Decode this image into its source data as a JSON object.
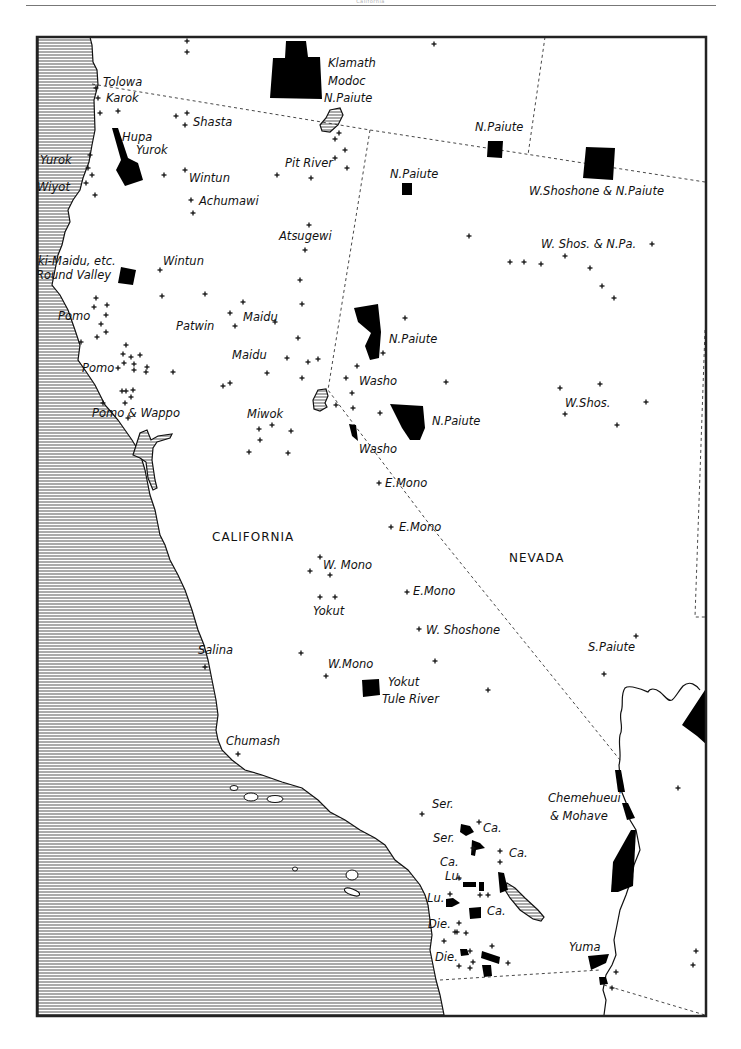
{
  "page": {
    "header_text": "California"
  },
  "colors": {
    "ink": "#111111",
    "paper": "#ffffff",
    "water_hatch": "#555555",
    "border": "#222222"
  },
  "states": [
    {
      "name": "CALIFORNIA",
      "x": 212,
      "y": 541
    },
    {
      "name": "NEVADA",
      "x": 509,
      "y": 562
    }
  ],
  "labels": [
    {
      "text": "Tolowa",
      "x": 103,
      "y": 86
    },
    {
      "text": "Karok",
      "x": 106,
      "y": 102
    },
    {
      "text": "Shasta",
      "x": 193,
      "y": 126
    },
    {
      "text": "Hupa",
      "x": 122,
      "y": 141
    },
    {
      "text": "Yurok",
      "x": 136,
      "y": 154
    },
    {
      "text": "Yurok",
      "x": 40,
      "y": 164
    },
    {
      "text": "Wiyot",
      "x": 37,
      "y": 191
    },
    {
      "text": "Wintun",
      "x": 189,
      "y": 182
    },
    {
      "text": "Achumawi",
      "x": 199,
      "y": 205
    },
    {
      "text": "Klamath",
      "x": 328,
      "y": 67
    },
    {
      "text": "Modoc",
      "x": 328,
      "y": 85
    },
    {
      "text": "N.Paiute",
      "x": 324,
      "y": 102
    },
    {
      "text": "N.Paiute",
      "x": 475,
      "y": 131
    },
    {
      "text": "Pit River",
      "x": 285,
      "y": 167
    },
    {
      "text": "N.Paiute",
      "x": 390,
      "y": 178
    },
    {
      "text": "W.Shoshone & N.Paiute",
      "x": 529,
      "y": 195
    },
    {
      "text": "Atsugewi",
      "x": 279,
      "y": 240
    },
    {
      "text": "W. Shos. & N.Pa.",
      "x": 541,
      "y": 248
    },
    {
      "text": "ki-Maidu, etc.",
      "x": 38,
      "y": 265
    },
    {
      "text": "Wintun",
      "x": 163,
      "y": 265
    },
    {
      "text": "Round Valley",
      "x": 36,
      "y": 279
    },
    {
      "text": "Pomo",
      "x": 58,
      "y": 320
    },
    {
      "text": "Maidu",
      "x": 243,
      "y": 321
    },
    {
      "text": "Patwin",
      "x": 176,
      "y": 330
    },
    {
      "text": "N.Paiute",
      "x": 389,
      "y": 343
    },
    {
      "text": "Maidu",
      "x": 232,
      "y": 359
    },
    {
      "text": "Pomo",
      "x": 82,
      "y": 372
    },
    {
      "text": "Washo",
      "x": 359,
      "y": 385
    },
    {
      "text": "W.Shos.",
      "x": 565,
      "y": 407
    },
    {
      "text": "Pomo & Wappo",
      "x": 92,
      "y": 417
    },
    {
      "text": "Miwok",
      "x": 247,
      "y": 418
    },
    {
      "text": "N.Paiute",
      "x": 432,
      "y": 425
    },
    {
      "text": "Washo",
      "x": 359,
      "y": 453
    },
    {
      "text": "E.Mono",
      "x": 385,
      "y": 487
    },
    {
      "text": "E.Mono",
      "x": 399,
      "y": 531
    },
    {
      "text": "W. Mono",
      "x": 323,
      "y": 569
    },
    {
      "text": "E.Mono",
      "x": 413,
      "y": 595
    },
    {
      "text": "Yokut",
      "x": 313,
      "y": 615
    },
    {
      "text": "W. Shoshone",
      "x": 426,
      "y": 634
    },
    {
      "text": "S.Paiute",
      "x": 588,
      "y": 651
    },
    {
      "text": "Salina",
      "x": 198,
      "y": 654
    },
    {
      "text": "W.Mono",
      "x": 328,
      "y": 668
    },
    {
      "text": "Yokut",
      "x": 388,
      "y": 686
    },
    {
      "text": "Tule River",
      "x": 382,
      "y": 703
    },
    {
      "text": "Chumash",
      "x": 226,
      "y": 745
    },
    {
      "text": "Chemehueui",
      "x": 548,
      "y": 802
    },
    {
      "text": "& Mohave",
      "x": 550,
      "y": 820
    },
    {
      "text": "Ser.",
      "x": 432,
      "y": 808
    },
    {
      "text": "Ca.",
      "x": 483,
      "y": 832
    },
    {
      "text": "Ser.",
      "x": 433,
      "y": 842
    },
    {
      "text": "Ca.",
      "x": 509,
      "y": 857
    },
    {
      "text": "Ca.",
      "x": 440,
      "y": 866
    },
    {
      "text": "Lu.",
      "x": 445,
      "y": 880
    },
    {
      "text": "Lu.",
      "x": 427,
      "y": 902
    },
    {
      "text": "Ca.",
      "x": 487,
      "y": 915
    },
    {
      "text": "Die.",
      "x": 428,
      "y": 928
    },
    {
      "text": "Yuma",
      "x": 569,
      "y": 951
    },
    {
      "text": "Die.",
      "x": 435,
      "y": 961
    }
  ],
  "settlements": [
    [
      187,
      41
    ],
    [
      187,
      52
    ],
    [
      434,
      44
    ],
    [
      96,
      88
    ],
    [
      98,
      98
    ],
    [
      100,
      113
    ],
    [
      118,
      111
    ],
    [
      176,
      116
    ],
    [
      187,
      113
    ],
    [
      185,
      125
    ],
    [
      90,
      155
    ],
    [
      88,
      168
    ],
    [
      92,
      175
    ],
    [
      86,
      183
    ],
    [
      95,
      195
    ],
    [
      164,
      175
    ],
    [
      185,
      170
    ],
    [
      277,
      175
    ],
    [
      335,
      158
    ],
    [
      345,
      150
    ],
    [
      335,
      139
    ],
    [
      339,
      133
    ],
    [
      347,
      168
    ],
    [
      311,
      178
    ],
    [
      193,
      213
    ],
    [
      191,
      200
    ],
    [
      309,
      225
    ],
    [
      305,
      250
    ],
    [
      469,
      236
    ],
    [
      510,
      262
    ],
    [
      524,
      262
    ],
    [
      541,
      264
    ],
    [
      565,
      256
    ],
    [
      590,
      268
    ],
    [
      602,
      286
    ],
    [
      614,
      298
    ],
    [
      652,
      244
    ],
    [
      160,
      270
    ],
    [
      162,
      296
    ],
    [
      96,
      298
    ],
    [
      94,
      307
    ],
    [
      107,
      305
    ],
    [
      106,
      315
    ],
    [
      101,
      324
    ],
    [
      106,
      332
    ],
    [
      97,
      337
    ],
    [
      81,
      342
    ],
    [
      205,
      294
    ],
    [
      243,
      302
    ],
    [
      230,
      313
    ],
    [
      235,
      326
    ],
    [
      300,
      280
    ],
    [
      302,
      304
    ],
    [
      298,
      338
    ],
    [
      275,
      322
    ],
    [
      126,
      345
    ],
    [
      123,
      354
    ],
    [
      131,
      357
    ],
    [
      140,
      355
    ],
    [
      134,
      364
    ],
    [
      124,
      363
    ],
    [
      118,
      368
    ],
    [
      147,
      367
    ],
    [
      146,
      372
    ],
    [
      134,
      370
    ],
    [
      173,
      372
    ],
    [
      230,
      383
    ],
    [
      223,
      386
    ],
    [
      287,
      358
    ],
    [
      318,
      359
    ],
    [
      302,
      378
    ],
    [
      267,
      373
    ],
    [
      308,
      362
    ],
    [
      126,
      391
    ],
    [
      125,
      403
    ],
    [
      131,
      397
    ],
    [
      122,
      391
    ],
    [
      133,
      390
    ],
    [
      128,
      418
    ],
    [
      103,
      403
    ],
    [
      405,
      318
    ],
    [
      357,
      366
    ],
    [
      346,
      378
    ],
    [
      352,
      393
    ],
    [
      353,
      408
    ],
    [
      380,
      413
    ],
    [
      383,
      353
    ],
    [
      446,
      382
    ],
    [
      560,
      388
    ],
    [
      600,
      384
    ],
    [
      565,
      414
    ],
    [
      646,
      402
    ],
    [
      617,
      425
    ],
    [
      259,
      429
    ],
    [
      272,
      425
    ],
    [
      291,
      431
    ],
    [
      260,
      440
    ],
    [
      249,
      452
    ],
    [
      288,
      453
    ],
    [
      336,
      405
    ],
    [
      379,
      483
    ],
    [
      391,
      527
    ],
    [
      320,
      557
    ],
    [
      310,
      571
    ],
    [
      330,
      575
    ],
    [
      320,
      597
    ],
    [
      335,
      597
    ],
    [
      407,
      592
    ],
    [
      419,
      629
    ],
    [
      301,
      653
    ],
    [
      326,
      676
    ],
    [
      435,
      661
    ],
    [
      488,
      690
    ],
    [
      636,
      636
    ],
    [
      604,
      674
    ],
    [
      205,
      667
    ],
    [
      238,
      754
    ],
    [
      678,
      788
    ],
    [
      422,
      814
    ],
    [
      479,
      822
    ],
    [
      473,
      848
    ],
    [
      500,
      851
    ],
    [
      500,
      862
    ],
    [
      459,
      878
    ],
    [
      480,
      895
    ],
    [
      488,
      895
    ],
    [
      450,
      894
    ],
    [
      459,
      923
    ],
    [
      455,
      932
    ],
    [
      457,
      932
    ],
    [
      466,
      933
    ],
    [
      444,
      941
    ],
    [
      470,
      951
    ],
    [
      492,
      946
    ],
    [
      473,
      962
    ],
    [
      459,
      966
    ],
    [
      470,
      968
    ],
    [
      508,
      963
    ],
    [
      616,
      972
    ],
    [
      612,
      988
    ],
    [
      696,
      951
    ],
    [
      693,
      965
    ]
  ],
  "reservations": [
    {
      "name": "klamath-modoc-npaiute",
      "points": "286,41 306,41 308,57 320,57 322,99 270,98 273,58 285,58"
    },
    {
      "name": "hupa-yurok",
      "points": "112,128 118,128 128,158 138,163 143,180 125,186 116,170 121,160"
    },
    {
      "name": "npaiute-oregon-line",
      "points": "488,141 503,141 502,158 487,157"
    },
    {
      "name": "npaiute-nv-north",
      "points": "402,183 412,183 412,195 402,195"
    },
    {
      "name": "wshoshone-npaiute",
      "points": "586,147 615,148 613,180 583,178"
    },
    {
      "name": "round-valley",
      "points": "121,267 136,270 133,285 118,283"
    },
    {
      "name": "npaiute-pyramid",
      "points": "354,308 378,304 381,332 379,358 370,360 365,346 371,333 358,322"
    },
    {
      "name": "npaiute-walker",
      "points": "390,404 423,406 425,428 420,440 410,440 402,428"
    },
    {
      "name": "washo",
      "points": "349,424 356,425 358,441 352,436"
    },
    {
      "name": "tule-river",
      "points": "362,680 379,679 380,695 363,697"
    },
    {
      "name": "mohave-north",
      "points": "615,770 621,770 625,792 618,792"
    },
    {
      "name": "mohave-mid",
      "points": "622,803 628,803 635,818 627,820"
    },
    {
      "name": "colorado-river",
      "points": "631,830 636,830 633,886 618,892 611,892 613,862"
    },
    {
      "name": "nv-east-edge",
      "points": "705,690 707,745 697,736 682,725"
    },
    {
      "name": "ser-ca-1",
      "points": "461,824 470,826 474,832 466,836 460,832"
    },
    {
      "name": "ser-2",
      "points": "472,840 480,843 485,848 476,850 475,856 471,855"
    },
    {
      "name": "lu-1",
      "points": "463,882 476,882 476,887 463,887"
    },
    {
      "name": "lu-2",
      "points": "479,882 484,882 484,891 479,891"
    },
    {
      "name": "ca-torres",
      "points": "498,872 504,873 508,890 500,893"
    },
    {
      "name": "lu-3",
      "points": "446,899 453,898 460,903 452,907 446,907"
    },
    {
      "name": "ca-3",
      "points": "469,908 481,907 481,918 470,919"
    },
    {
      "name": "die-1",
      "points": "460,949 467,949 469,955 461,956"
    },
    {
      "name": "die-2",
      "points": "482,951 500,957 499,964 481,958"
    },
    {
      "name": "die-3",
      "points": "482,965 491,965 492,976 484,977"
    },
    {
      "name": "yuma",
      "points": "588,956 609,954 606,963 591,970"
    },
    {
      "name": "yuma-south",
      "points": "599,977 606,977 608,984 600,985"
    }
  ]
}
